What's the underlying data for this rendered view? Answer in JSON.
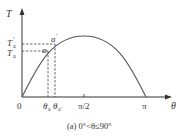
{
  "figure": {
    "y_axis_label": "T",
    "x_axis_label": "θ",
    "origin_label": "0",
    "y_ticks": [
      {
        "label": "T",
        "sub": "a",
        "prime": "'"
      },
      {
        "label": "T",
        "sub": "a",
        "prime": ""
      }
    ],
    "x_ticks": [
      {
        "label": "θ",
        "sub": "a",
        "prime": ""
      },
      {
        "label": "θ",
        "sub": "a",
        "prime": "'"
      },
      {
        "label": "π/2"
      },
      {
        "label": "π"
      }
    ],
    "points": [
      {
        "label": "a",
        "prime": "'"
      },
      {
        "label": "a",
        "prime": ""
      }
    ],
    "caption": "(a) 0°<θ≤90°",
    "colors": {
      "axis": "#333333",
      "curve": "#555555",
      "dash": "#444444"
    }
  }
}
